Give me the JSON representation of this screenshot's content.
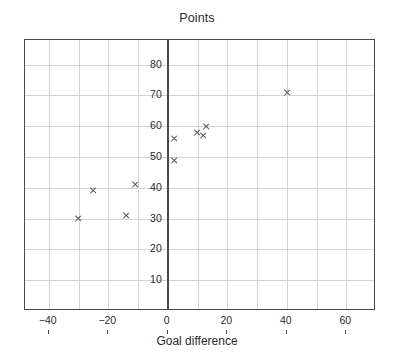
{
  "chart_data": {
    "type": "scatter",
    "title": "Points",
    "xlabel": "Goal difference",
    "ylabel": "",
    "xlim": [
      -48,
      70
    ],
    "ylim": [
      0,
      88
    ],
    "grid": true,
    "legend": "none",
    "marker": "x",
    "marker_color": "#555555",
    "xticks": [
      -40,
      -20,
      0,
      20,
      40,
      60
    ],
    "xtick_labels": [
      "−40",
      "−20",
      "0",
      "20",
      "40",
      "60"
    ],
    "yticks": [
      10,
      20,
      30,
      40,
      50,
      60,
      70,
      80
    ],
    "ytick_labels": [
      "10",
      "20",
      "30",
      "40",
      "50",
      "60",
      "70",
      "80"
    ],
    "x_minor_gridlines": [
      -40,
      -30,
      -20,
      -10,
      0,
      10,
      20,
      30,
      40,
      50,
      60
    ],
    "y_minor_gridlines": [
      10,
      20,
      30,
      40,
      50,
      60,
      70,
      80
    ],
    "points": [
      {
        "x": -30,
        "y": 30
      },
      {
        "x": -25,
        "y": 39
      },
      {
        "x": -14,
        "y": 31
      },
      {
        "x": -11,
        "y": 41
      },
      {
        "x": 2,
        "y": 49
      },
      {
        "x": 2,
        "y": 56
      },
      {
        "x": 10,
        "y": 58
      },
      {
        "x": 12,
        "y": 57
      },
      {
        "x": 13,
        "y": 60
      },
      {
        "x": 40,
        "y": 71
      }
    ]
  },
  "axes": {
    "zero_line_value": 0
  }
}
